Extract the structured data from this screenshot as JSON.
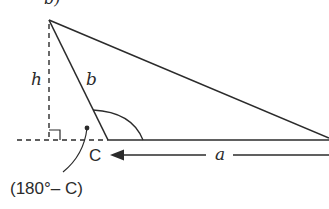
{
  "figure": {
    "partial_label": "b)",
    "labels": {
      "height": "h",
      "side_b": "b",
      "side_a": "a",
      "vertex_c": "C",
      "exterior_angle": "(180°– C)"
    },
    "colors": {
      "stroke": "#2b2b2b",
      "background": "#ffffff"
    }
  }
}
